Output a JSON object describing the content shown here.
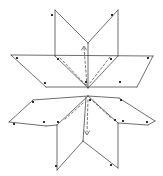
{
  "figure": {
    "width": 163,
    "height": 176,
    "background_color": "#ffffff",
    "line_color": "#3d3d3d",
    "dashed_line_color": "#4a4a4a",
    "dot_color": "#1a1a1a",
    "line_width": 0.75,
    "dash_pattern": "2.2,2.2",
    "dot_size": 1.9,
    "solid_lines": [
      [
        11,
        55,
        153,
        56
      ],
      [
        11,
        55,
        46,
        87
      ],
      [
        46,
        87,
        137,
        87
      ],
      [
        153,
        56,
        137,
        87
      ],
      [
        55,
        10,
        55,
        56
      ],
      [
        55,
        10,
        88,
        43
      ],
      [
        55,
        56,
        88,
        88
      ],
      [
        118,
        10,
        118,
        56
      ],
      [
        118,
        10,
        88,
        43
      ],
      [
        118,
        56,
        88,
        88
      ],
      [
        88,
        43,
        88,
        88
      ],
      [
        9,
        122,
        33,
        100
      ],
      [
        33,
        100,
        88,
        96
      ],
      [
        9,
        122,
        46,
        126
      ],
      [
        46,
        126,
        57,
        125
      ],
      [
        88,
        96,
        57,
        125
      ],
      [
        57,
        125,
        57,
        170
      ],
      [
        57,
        170,
        83,
        141
      ],
      [
        86,
        97,
        83,
        141
      ],
      [
        88,
        96,
        118,
        123
      ],
      [
        118,
        123,
        118,
        168
      ],
      [
        118,
        168,
        83,
        141
      ],
      [
        118,
        123,
        148,
        125
      ],
      [
        148,
        125,
        155,
        121
      ],
      [
        155,
        121,
        119,
        98
      ],
      [
        119,
        98,
        88,
        96
      ]
    ],
    "dashed_lines": [
      [
        84,
        48,
        87,
        86
      ],
      [
        60,
        58,
        86,
        85
      ],
      [
        110,
        57,
        90,
        83
      ],
      [
        88,
        100,
        87,
        132
      ],
      [
        83,
        103,
        64,
        120
      ],
      [
        93,
        101,
        112,
        119
      ]
    ],
    "arrowheads": [
      {
        "points": "81.5,50 84,46 86.5,50",
        "direction": "up"
      },
      {
        "points": "84.5,131 87,135 89.5,131",
        "direction": "down"
      }
    ],
    "corner_dots": [
      [
        52,
        15
      ],
      [
        112,
        15
      ],
      [
        17,
        58
      ],
      [
        45,
        83
      ],
      [
        58,
        59
      ],
      [
        111,
        59
      ],
      [
        148,
        58
      ],
      [
        120,
        82
      ],
      [
        86,
        82
      ],
      [
        33,
        102
      ],
      [
        14,
        124
      ],
      [
        44,
        122
      ],
      [
        58,
        122
      ],
      [
        56,
        166
      ],
      [
        111,
        165
      ],
      [
        115,
        120
      ],
      [
        123,
        121
      ],
      [
        121,
        100
      ],
      [
        147,
        122
      ],
      [
        90,
        100
      ]
    ]
  }
}
